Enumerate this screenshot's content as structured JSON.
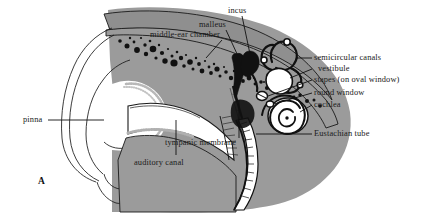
{
  "figure": {
    "panel_letter": "A",
    "background_color": "#ffffff",
    "tissue_gray": "#9b9b9b",
    "bone_gray": "#a3a3a3",
    "line_color": "#1a1a1a",
    "cavity_white": "#ffffff",
    "dark_fill": "#111111"
  },
  "labels": [
    {
      "id": "middle-ear-chamber",
      "text": "middle-ear chamber",
      "x": 134,
      "y": 36,
      "align": "left"
    },
    {
      "id": "malleus",
      "text": "malleus",
      "x": 213,
      "y": 25,
      "align": "left"
    },
    {
      "id": "incus",
      "text": "incus",
      "x": 231,
      "y": 10,
      "align": "left"
    },
    {
      "id": "semicircular-canals",
      "text": "semicircular canals",
      "x": 314,
      "y": 59,
      "align": "left"
    },
    {
      "id": "vestibule",
      "text": "vestibule",
      "x": 318,
      "y": 71,
      "align": "left"
    },
    {
      "id": "stapes",
      "text": "stapes (on oval window)",
      "x": 314,
      "y": 82,
      "align": "left"
    },
    {
      "id": "round-window",
      "text": "round window",
      "x": 314,
      "y": 95,
      "align": "left"
    },
    {
      "id": "cochlea",
      "text": "cochlea",
      "x": 314,
      "y": 107,
      "align": "left"
    },
    {
      "id": "eustachian-tube",
      "text": "Eustachian tube",
      "x": 314,
      "y": 136,
      "align": "left"
    },
    {
      "id": "tympanic-membrane",
      "text": "tympanic membrane",
      "x": 165,
      "y": 143,
      "align": "left"
    },
    {
      "id": "auditory-canal",
      "text": "auditory canal",
      "x": 134,
      "y": 163,
      "align": "left"
    },
    {
      "id": "pinna",
      "text": "pinna",
      "x": 24,
      "y": 120,
      "align": "left"
    }
  ]
}
